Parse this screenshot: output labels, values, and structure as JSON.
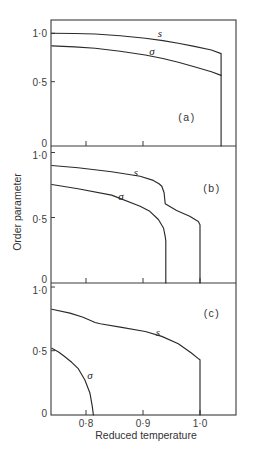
{
  "chart_data": {
    "type": "line",
    "title": "",
    "xlabel": "Reduced temperature",
    "ylabel": "Order parameter",
    "xlim": [
      0.74,
      1.063
    ],
    "xticks": [
      0.8,
      0.9,
      1.0
    ],
    "xtick_labels": [
      "0·8",
      "0·9",
      "1·0"
    ],
    "grid": false,
    "legend": "none (curves labelled inline)",
    "panels": [
      {
        "label": "(a)",
        "ylim": [
          0,
          1.14
        ],
        "yticks": [
          0,
          0.5,
          1.0
        ],
        "ytick_labels": [
          "0",
          "0·5",
          "1·0"
        ],
        "xtick_marks": [
          0.8,
          0.9
        ],
        "series": [
          {
            "name": "s",
            "points": [
              [
                0.74,
                1.0
              ],
              [
                0.78,
                0.998
              ],
              [
                0.816,
                0.993
              ],
              [
                0.86,
                0.975
              ],
              [
                0.904,
                0.948
              ],
              [
                0.935,
                0.925
              ],
              [
                0.962,
                0.897
              ],
              [
                0.99,
                0.865
              ],
              [
                1.02,
                0.827
              ],
              [
                1.037,
                0.79
              ],
              [
                1.037,
                0
              ]
            ]
          },
          {
            "name": "σ",
            "points": [
              [
                0.74,
                0.87
              ],
              [
                0.78,
                0.86
              ],
              [
                0.816,
                0.845
              ],
              [
                0.86,
                0.815
              ],
              [
                0.904,
                0.776
              ],
              [
                0.935,
                0.74
              ],
              [
                0.962,
                0.7
              ],
              [
                0.99,
                0.655
              ],
              [
                1.02,
                0.603
              ],
              [
                1.037,
                0.565
              ]
            ]
          }
        ]
      },
      {
        "label": "(b)",
        "ylim": [
          0,
          1.05
        ],
        "yticks": [
          0,
          0.5,
          1.0
        ],
        "ytick_labels": [
          "0",
          "0·5",
          "1·0"
        ],
        "xtick_marks": [
          0.8,
          0.9,
          1.0
        ],
        "series": [
          {
            "name": "s",
            "points": [
              [
                0.74,
                0.9
              ],
              [
                0.786,
                0.882
              ],
              [
                0.845,
                0.852
              ],
              [
                0.895,
                0.818
              ],
              [
                0.918,
                0.785
              ],
              [
                0.928,
                0.76
              ],
              [
                0.933,
                0.741
              ],
              [
                0.937,
                0.69
              ],
              [
                0.939,
                0.605
              ],
              [
                0.959,
                0.554
              ],
              [
                0.982,
                0.51
              ],
              [
                0.997,
                0.47
              ],
              [
                1.0,
                0.445
              ],
              [
                1.0,
                0
              ]
            ]
          },
          {
            "name": "σ",
            "points": [
              [
                0.74,
                0.754
              ],
              [
                0.786,
                0.721
              ],
              [
                0.845,
                0.672
              ],
              [
                0.895,
                0.587
              ],
              [
                0.912,
                0.548
              ],
              [
                0.927,
                0.485
              ],
              [
                0.936,
                0.42
              ],
              [
                0.939,
                0.356
              ],
              [
                0.94,
                0.32
              ],
              [
                0.94,
                0
              ]
            ]
          }
        ]
      },
      {
        "label": "(c)",
        "ylim": [
          0,
          1.03
        ],
        "yticks": [
          0,
          0.5,
          1.0
        ],
        "ytick_labels": [
          "0",
          "0·5",
          "1·0"
        ],
        "xtick_marks": [
          0.8,
          0.9,
          1.0
        ],
        "series": [
          {
            "name": "s",
            "points": [
              [
                0.74,
                0.826
              ],
              [
                0.772,
                0.795
              ],
              [
                0.795,
                0.763
              ],
              [
                0.816,
                0.721
              ],
              [
                0.825,
                0.711
              ],
              [
                0.86,
                0.685
              ],
              [
                0.904,
                0.651
              ],
              [
                0.933,
                0.612
              ],
              [
                0.962,
                0.555
              ],
              [
                0.985,
                0.482
              ],
              [
                0.998,
                0.435
              ],
              [
                1.0,
                0.43
              ],
              [
                1.0,
                0
              ]
            ]
          },
          {
            "name": "σ",
            "points": [
              [
                0.74,
                0.519
              ],
              [
                0.752,
                0.49
              ],
              [
                0.763,
                0.453
              ],
              [
                0.775,
                0.41
              ],
              [
                0.786,
                0.363
              ],
              [
                0.798,
                0.272
              ],
              [
                0.807,
                0.169
              ],
              [
                0.811,
                0.065
              ],
              [
                0.813,
                0
              ]
            ]
          }
        ]
      }
    ]
  }
}
